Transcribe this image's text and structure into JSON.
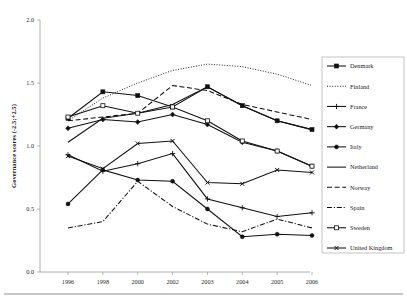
{
  "chart_data": {
    "type": "line",
    "title": "",
    "xlabel": "",
    "ylabel": "Governance scores (-2.5;+2.5)",
    "categories": [
      "1996",
      "1998",
      "2000",
      "2002",
      "2003",
      "2004",
      "2005",
      "2006"
    ],
    "x": [
      1996,
      1998,
      2000,
      2002,
      2003,
      2004,
      2005,
      2006
    ],
    "ylim": [
      0.0,
      2.0
    ],
    "yticks": [
      0.0,
      0.5,
      1.0,
      1.5,
      2.0
    ],
    "ytick_labels": [
      "0.0",
      "0.5",
      "1.0",
      "1.5",
      "2.0"
    ],
    "grid": false,
    "legend_position": "right",
    "series": [
      {
        "name": "Denmark",
        "marker": "square-filled",
        "dash": "solid",
        "values": [
          1.22,
          1.43,
          1.4,
          1.31,
          1.47,
          1.32,
          1.2,
          1.13
        ]
      },
      {
        "name": "Finland",
        "marker": "none",
        "dash": "dotted",
        "values": [
          1.2,
          1.38,
          1.5,
          1.6,
          1.65,
          1.63,
          1.57,
          1.48
        ]
      },
      {
        "name": "France",
        "marker": "plus",
        "dash": "solid",
        "values": [
          0.93,
          0.8,
          0.86,
          0.94,
          0.58,
          0.51,
          0.44,
          0.47
        ]
      },
      {
        "name": "Germany",
        "marker": "diamond-filled",
        "dash": "solid",
        "values": [
          1.14,
          1.21,
          1.19,
          1.25,
          1.17,
          1.03,
          0.96,
          0.84
        ]
      },
      {
        "name": "Italy",
        "marker": "circle-filled",
        "dash": "solid",
        "values": [
          0.54,
          0.81,
          0.73,
          0.72,
          0.5,
          0.28,
          0.3,
          0.29
        ]
      },
      {
        "name": "Netherland",
        "marker": "none",
        "dash": "solid",
        "values": [
          1.03,
          1.22,
          1.26,
          1.33,
          1.47,
          1.32,
          1.2,
          1.13
        ]
      },
      {
        "name": "Norway",
        "marker": "none",
        "dash": "dashed",
        "values": [
          1.2,
          1.23,
          1.26,
          1.48,
          1.44,
          1.33,
          1.27,
          1.21
        ]
      },
      {
        "name": "Spain",
        "marker": "none",
        "dash": "dash-dot",
        "values": [
          0.35,
          0.4,
          0.72,
          0.52,
          0.38,
          0.32,
          0.42,
          0.35
        ]
      },
      {
        "name": "Sweden",
        "marker": "square-open",
        "dash": "solid",
        "values": [
          1.23,
          1.32,
          1.26,
          1.31,
          1.2,
          1.04,
          0.96,
          0.84
        ]
      },
      {
        "name": "United Kingdom",
        "marker": "cross-filled",
        "dash": "solid",
        "values": [
          0.92,
          0.82,
          1.02,
          1.04,
          0.71,
          0.7,
          0.81,
          0.79
        ]
      }
    ]
  },
  "legend": {
    "entries": [
      {
        "label": "Denmark"
      },
      {
        "label": "Finland"
      },
      {
        "label": "France"
      },
      {
        "label": "Germany"
      },
      {
        "label": "Italy"
      },
      {
        "label": "Netherland"
      },
      {
        "label": "Norway"
      },
      {
        "label": "Spain"
      },
      {
        "label": "Sweden"
      },
      {
        "label": "United Kingdom"
      }
    ]
  },
  "colors": {
    "line": "#101010",
    "axis": "#9a9a9a",
    "text": "#1a1a1a",
    "background": "#ffffff"
  }
}
